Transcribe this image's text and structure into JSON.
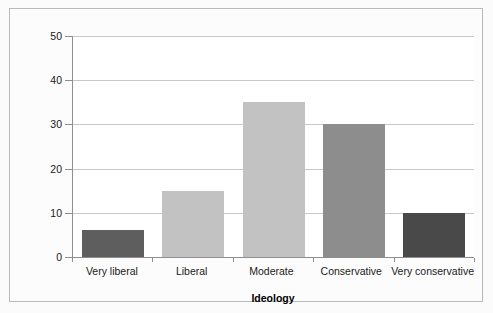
{
  "chart_data": {
    "type": "bar",
    "title": "",
    "subtitle": "",
    "xlabel": "Ideology",
    "ylabel": "Percentage of Americans",
    "categories": [
      "Very liberal",
      "Liberal",
      "Moderate",
      "Conservative",
      "Very conservative"
    ],
    "values": [
      6,
      15,
      35,
      30,
      10
    ],
    "bar_colors": [
      "#5e5e5e",
      "#c2c2c2",
      "#c2c2c2",
      "#8d8d8d",
      "#494949"
    ],
    "ylim": [
      0,
      50
    ],
    "yticks": [
      0,
      10,
      20,
      30,
      40,
      50
    ],
    "ytick_labels": [
      "0",
      "10",
      "20",
      "30",
      "40",
      "50"
    ],
    "grid": true,
    "grid_axis": "y",
    "legend": false,
    "legend_position": "none",
    "series": [
      {
        "name": "Percentage of Americans",
        "values": [
          6,
          15,
          35,
          30,
          10
        ]
      }
    ]
  },
  "style": {
    "frame_border_color": "#b9b9b9",
    "axis_color": "#8e8e8e",
    "gridline_color": "#c8c8c8",
    "plot_background": "#ffffff",
    "figure_background": "#fbfbfb",
    "text_color": "#1a1a1a"
  }
}
